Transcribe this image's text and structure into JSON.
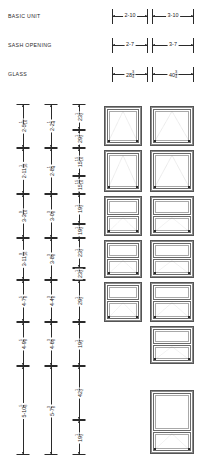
{
  "sheet": {
    "title": "window-unit-size-table",
    "row_labels": [
      {
        "id": "basic-unit",
        "text": "BASIC UNIT"
      },
      {
        "id": "sash-opening",
        "text": "SASH OPENING"
      },
      {
        "id": "glass",
        "text": "GLASS"
      }
    ],
    "width_columns": [
      {
        "id": "narrow",
        "basic_unit": "2-10",
        "sash_opening": "2-7",
        "glass_whole": "28",
        "glass_num": "3",
        "glass_den": "4"
      },
      {
        "id": "wide",
        "basic_unit": "3-10",
        "sash_opening": "3-7",
        "glass_whole": "40",
        "glass_num": "3",
        "glass_den": "4"
      }
    ],
    "height_columns": [
      {
        "id": "basic-unit-height",
        "values": [
          {
            "whole": "2-5",
            "num": "1",
            "den": "16"
          },
          {
            "whole": "2-11",
            "num": "1",
            "den": "16"
          },
          {
            "whole": "3-3",
            "num": "9",
            "den": "16"
          },
          {
            "whole": "3-11",
            "num": "9",
            "den": "16"
          },
          {
            "whole": "4-7",
            "num": "5",
            "den": "8"
          },
          {
            "whole": "4-9",
            "num": "5",
            "den": "8"
          },
          {
            "whole": "5-10",
            "num": "5",
            "den": "8"
          }
        ]
      },
      {
        "id": "sash-opening-height",
        "values": [
          {
            "whole": "2-2",
            "num": "1",
            "den": "4"
          },
          {
            "whole": "2-8",
            "num": "1",
            "den": "4"
          },
          {
            "whole": "3-0",
            "num": "3",
            "den": "8"
          },
          {
            "whole": "3-8",
            "num": "3",
            "den": "8"
          },
          {
            "whole": "4-4",
            "num": "3",
            "den": "8"
          },
          {
            "whole": "4-6",
            "num": "3",
            "den": "8"
          },
          {
            "whole": "5-7",
            "num": "3",
            "den": "8"
          }
        ]
      },
      {
        "id": "glass-height",
        "values": [
          {
            "whole": "23",
            "num": "1",
            "den": "2"
          },
          {
            "whole": "29",
            "num": "1",
            "den": "2"
          },
          {
            "whole": "15",
            "num": "15",
            "den": "16"
          },
          {
            "whole": "15",
            "num": "15",
            "den": "16"
          },
          {
            "whole": "19",
            "num": "1",
            "den": "2"
          },
          {
            "whole": "19",
            "num": "1",
            "den": "2"
          },
          {
            "whole": "23",
            "num": "1",
            "den": "2"
          },
          {
            "whole": "23",
            "num": "1",
            "den": "2"
          },
          {
            "whole": "29",
            "num": "1",
            "den": "2"
          },
          {
            "whole": "19",
            "num": "1",
            "den": "2"
          },
          {
            "whole": "42",
            "num": "1",
            "den": "2"
          },
          {
            "whole": "19",
            "num": "1",
            "den": "2"
          }
        ]
      }
    ],
    "units": [
      {
        "id": "unit-narrow-1",
        "column": "narrow",
        "panels": 1,
        "operating": "bottom"
      },
      {
        "id": "unit-narrow-2",
        "column": "narrow",
        "panels": 1,
        "operating": "bottom"
      },
      {
        "id": "unit-narrow-3",
        "column": "narrow",
        "panels": 2,
        "operating": "bottom"
      },
      {
        "id": "unit-narrow-4",
        "column": "narrow",
        "panels": 2,
        "operating": "bottom"
      },
      {
        "id": "unit-narrow-5",
        "column": "narrow",
        "panels": 2,
        "operating": "bottom"
      },
      {
        "id": "unit-wide-1",
        "column": "wide",
        "panels": 1,
        "operating": "bottom"
      },
      {
        "id": "unit-wide-2",
        "column": "wide",
        "panels": 1,
        "operating": "bottom"
      },
      {
        "id": "unit-wide-3",
        "column": "wide",
        "panels": 2,
        "operating": "bottom"
      },
      {
        "id": "unit-wide-4",
        "column": "wide",
        "panels": 2,
        "operating": "bottom"
      },
      {
        "id": "unit-wide-5",
        "column": "wide",
        "panels": 2,
        "operating": "bottom"
      },
      {
        "id": "unit-wide-6",
        "column": "wide",
        "panels": 2,
        "operating": "bottom"
      },
      {
        "id": "unit-wide-7",
        "column": "wide",
        "panels": 2,
        "operating": "bottom"
      }
    ],
    "colors": {
      "line": "#2a2a2a",
      "frame": "#6a6a6a",
      "hinge": "#777777"
    }
  }
}
